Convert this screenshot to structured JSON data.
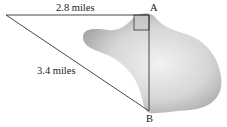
{
  "diagram": {
    "type": "right-triangle-over-lake",
    "labels": {
      "top_side": "2.8 miles",
      "hypotenuse": "3.4 miles",
      "point_a": "A",
      "point_b": "B"
    },
    "colors": {
      "line": "#333333",
      "lake_light": "#eeeeee",
      "lake_dark": "#a9a9a9",
      "right_angle_fill": "#c8c8c8"
    }
  }
}
